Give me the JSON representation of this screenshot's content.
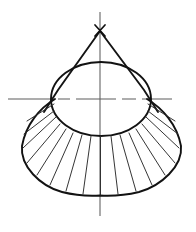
{
  "figure": {
    "type": "engineering-line-drawing",
    "canvas": {
      "width": 196,
      "height": 232,
      "background": "#ffffff"
    },
    "colors": {
      "outline": "#121212",
      "element_line": "#2a2a2a",
      "centerline": "#5d5d5d",
      "background": "#ffffff"
    },
    "apex": {
      "x": 100,
      "y": 31,
      "label": "apex"
    },
    "ellipse": {
      "cx": 101,
      "cy": 99,
      "rx": 50,
      "ry": 37,
      "top_y": 62,
      "bottom_y": 136,
      "left_x": 51,
      "right_x": 151
    },
    "vertical_centerline": {
      "x": 100,
      "y1": 12,
      "y2": 216
    },
    "horizontal_centerline": {
      "y": 99,
      "x1": 8,
      "x2": 190,
      "pattern": "dash-dot",
      "dasharray": "34 5 11 5"
    },
    "tangents": [
      {
        "name": "left-tangent",
        "x1": 100,
        "y1": 31,
        "x2": 44,
        "y2": 112
      },
      {
        "name": "right-tangent",
        "x1": 100,
        "y1": 31,
        "x2": 158,
        "y2": 112
      }
    ],
    "outer_arc": {
      "leftmost": {
        "x": 22,
        "y": 146
      },
      "rightmost": {
        "x": 181,
        "y": 146
      },
      "bottom": {
        "x": 100,
        "y": 195
      },
      "description": "fan-shaped developed surface boundary"
    },
    "element_line_count": 17,
    "element_lines_note": "radial lines from the ellipse rim out to the fan boundary"
  }
}
